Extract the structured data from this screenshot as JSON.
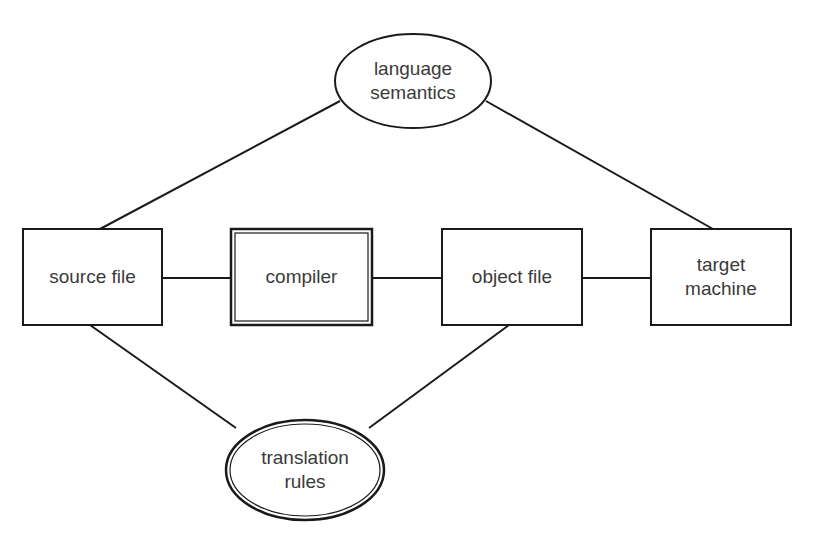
{
  "diagram": {
    "nodes": [
      {
        "id": "language-semantics",
        "shape": "ellipse",
        "label": "language\nsemantics",
        "border": "single"
      },
      {
        "id": "source-file",
        "shape": "rect",
        "label": "source file",
        "border": "single"
      },
      {
        "id": "compiler",
        "shape": "rect",
        "label": "compiler",
        "border": "double"
      },
      {
        "id": "object-file",
        "shape": "rect",
        "label": "object file",
        "border": "single"
      },
      {
        "id": "target-machine",
        "shape": "rect",
        "label": "target\nmachine",
        "border": "single"
      },
      {
        "id": "translation-rules",
        "shape": "ellipse",
        "label": "translation\nrules",
        "border": "double"
      }
    ],
    "edges": [
      [
        "language-semantics",
        "source-file"
      ],
      [
        "language-semantics",
        "target-machine"
      ],
      [
        "source-file",
        "compiler"
      ],
      [
        "compiler",
        "object-file"
      ],
      [
        "object-file",
        "target-machine"
      ],
      [
        "source-file",
        "translation-rules"
      ],
      [
        "object-file",
        "translation-rules"
      ]
    ],
    "colors": {
      "stroke": "#1a1a1a",
      "text": "#3a3a3a",
      "background": "#ffffff"
    }
  }
}
